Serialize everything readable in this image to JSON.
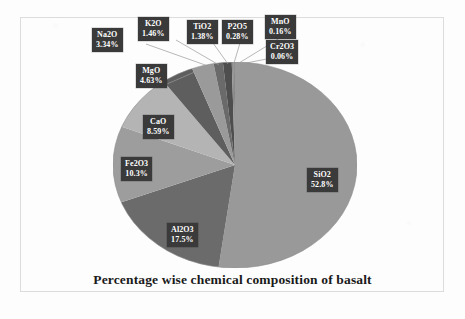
{
  "figure": {
    "title": "Percentage wise chemical composition of basalt",
    "frame_color": "#dcdcdc",
    "background": "#fdfdfd"
  },
  "chart_data": {
    "type": "pie",
    "title": "Percentage wise chemical composition of basalt",
    "xlabel": "",
    "ylabel": "",
    "legend": "none (direct callout labels)",
    "grid": false,
    "units": "percent",
    "start_angle_deg": -90,
    "direction": "clockwise",
    "categories": [
      "SiO2",
      "Al2O3",
      "Fe2O3",
      "CaO",
      "MgO",
      "Na2O",
      "K2O",
      "TiO2",
      "P2O5",
      "MnO",
      "Cr2O3"
    ],
    "values": [
      52.8,
      17.5,
      10.3,
      8.59,
      4.63,
      3.34,
      1.46,
      1.38,
      0.28,
      0.16,
      0.06
    ],
    "slices": [
      {
        "label": "SiO2",
        "value": 52.8,
        "display": "52.8%",
        "color": "#999999"
      },
      {
        "label": "Al2O3",
        "value": 17.5,
        "display": "17.5%",
        "color": "#6b6b6b"
      },
      {
        "label": "Fe2O3",
        "value": 10.3,
        "display": "10.3%",
        "color": "#9d9d9d"
      },
      {
        "label": "CaO",
        "value": 8.59,
        "display": "8.59%",
        "color": "#b4b4b4"
      },
      {
        "label": "MgO",
        "value": 4.63,
        "display": "4.63%",
        "color": "#5e5e5e"
      },
      {
        "label": "Na2O",
        "value": 3.34,
        "display": "3.34%",
        "color": "#9a9a9a"
      },
      {
        "label": "K2O",
        "value": 1.46,
        "display": "1.46%",
        "color": "#6a6a6a"
      },
      {
        "label": "TiO2",
        "value": 1.38,
        "display": "1.38%",
        "color": "#4e4e4e"
      },
      {
        "label": "P2O5",
        "value": 0.28,
        "display": "0.28%",
        "color": "#8d8d8d"
      },
      {
        "label": "MnO",
        "value": 0.16,
        "display": "0.16%",
        "color": "#656565"
      },
      {
        "label": "Cr2O3",
        "value": 0.06,
        "display": "0.06%",
        "color": "#7a7a7a"
      }
    ]
  },
  "callouts": {
    "sio2": {
      "name": "SiO2",
      "percent": "52.8%"
    },
    "al2o3": {
      "name": "Al2O3",
      "percent": "17.5%"
    },
    "fe2o3": {
      "name": "Fe2O3",
      "percent": "10.3%"
    },
    "cao": {
      "name": "CaO",
      "percent": "8.59%"
    },
    "mgo": {
      "name": "MgO",
      "percent": "4.63%"
    },
    "na2o": {
      "name": "Na2O",
      "percent": "3.34%"
    },
    "k2o": {
      "name": "K2O",
      "percent": "1.46%"
    },
    "tio2": {
      "name": "TiO2",
      "percent": "1.38%"
    },
    "p2o5": {
      "name": "P2O5",
      "percent": "0.28%"
    },
    "mno": {
      "name": "MnO",
      "percent": "0.16%"
    },
    "cr2o3": {
      "name": "Cr2O3",
      "percent": "0.06%"
    }
  }
}
